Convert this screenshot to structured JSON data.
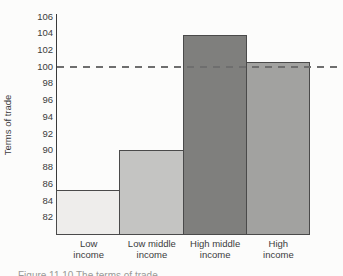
{
  "figure": {
    "caption_partial": "Figure 11.10   The terms of trade"
  },
  "chart_data": {
    "type": "bar",
    "title": "",
    "xlabel": "",
    "ylabel": "Terms of trade",
    "categories": [
      "Low income",
      "Low middle income",
      "High middle income",
      "High income"
    ],
    "category_label_lines": [
      [
        "Low",
        "income"
      ],
      [
        "Low middle",
        "income"
      ],
      [
        "High middle",
        "income"
      ],
      [
        "High",
        "income"
      ]
    ],
    "values": [
      85.3,
      90.0,
      103.8,
      100.6
    ],
    "bar_colors": [
      "#eeedeb",
      "#c4c4c2",
      "#7f7f7d",
      "#a2a2a0"
    ],
    "bar_border_color": "#4a4a4a",
    "ylim": [
      80,
      106.3
    ],
    "yticks": [
      82,
      84,
      86,
      88,
      90,
      92,
      94,
      96,
      98,
      100,
      102,
      104,
      106
    ],
    "reference_line": {
      "value": 100,
      "style": "dashed",
      "color": "#6e6e6e"
    },
    "grid": false,
    "legend": null
  }
}
